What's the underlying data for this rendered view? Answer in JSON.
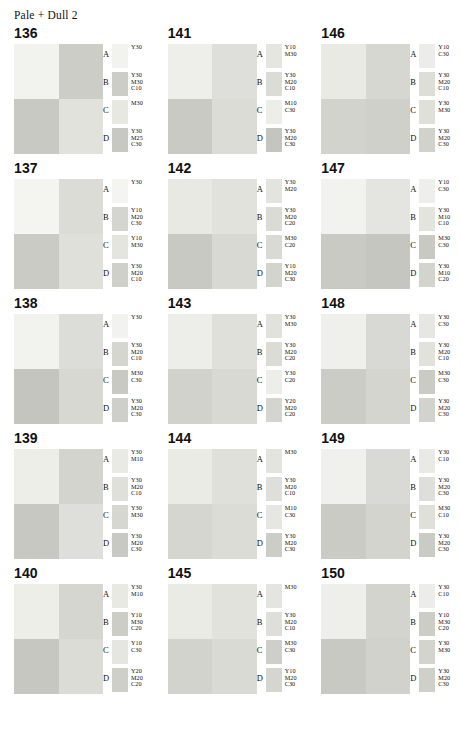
{
  "title": "Pale + Dull 2",
  "row_labels": [
    "A",
    "B",
    "C",
    "D"
  ],
  "chart_data": {
    "type": "table",
    "title": "Pale + Dull 2",
    "columns": 3,
    "rows": 5,
    "row_labels": [
      "A",
      "B",
      "C",
      "D"
    ],
    "groups": [
      {
        "number": "136",
        "quad": [
          "#f2f2ef",
          "#cdcdc8",
          "#c9c9c3",
          "#e2e2dd"
        ],
        "swatches": [
          {
            "label": "A",
            "chip": "#f2f2ef",
            "spec": "Y30"
          },
          {
            "label": "B",
            "chip": "#cdcdc8",
            "spec": "Y30\nM30\nC10"
          },
          {
            "label": "C",
            "chip": "#e8e8e2",
            "spec": "M30"
          },
          {
            "label": "D",
            "chip": "#c8c8c2",
            "spec": "Y30\nM25\nC30"
          }
        ]
      },
      {
        "number": "141",
        "quad": [
          "#eeeeea",
          "#dededa",
          "#cacac5",
          "#dcdcd7"
        ],
        "swatches": [
          {
            "label": "A",
            "chip": "#e6e6e1",
            "spec": "Y10\nM30"
          },
          {
            "label": "B",
            "chip": "#dcdcd7",
            "spec": "Y30\nM20\nC10"
          },
          {
            "label": "C",
            "chip": "#eeeee9",
            "spec": "M10\nC30"
          },
          {
            "label": "D",
            "chip": "#c5c5bf",
            "spec": "Y30\nM20\nC30"
          }
        ]
      },
      {
        "number": "146",
        "quad": [
          "#eaeae5",
          "#d7d7d2",
          "#d3d3ce",
          "#d0d0cb"
        ],
        "swatches": [
          {
            "label": "A",
            "chip": "#ececea",
            "spec": "Y10\nC30"
          },
          {
            "label": "B",
            "chip": "#dedeD9",
            "spec": "Y30\nM20\nC10"
          },
          {
            "label": "C",
            "chip": "#e0e0db",
            "spec": "Y30\nM30"
          },
          {
            "label": "D",
            "chip": "#d2d2cd",
            "spec": "Y30\nM20\nC30"
          }
        ]
      },
      {
        "number": "137",
        "quad": [
          "#f4f4f1",
          "#dcdcd7",
          "#cbcbc6",
          "#e0e0db"
        ],
        "swatches": [
          {
            "label": "A",
            "chip": "#f4f4f1",
            "spec": "Y30"
          },
          {
            "label": "B",
            "chip": "#d5d5d0",
            "spec": "Y10\nM20\nC30"
          },
          {
            "label": "C",
            "chip": "#e5e5e0",
            "spec": "Y10\nM30"
          },
          {
            "label": "D",
            "chip": "#d0d0cb",
            "spec": "Y30\nM20\nC10"
          }
        ]
      },
      {
        "number": "142",
        "quad": [
          "#e9e9e4",
          "#e2e2dd",
          "#c9c9c4",
          "#d9d9d4"
        ],
        "swatches": [
          {
            "label": "A",
            "chip": "#e4e4df",
            "spec": "Y30\nM20"
          },
          {
            "label": "B",
            "chip": "#dbdbd6",
            "spec": "Y30\nM20\nC20"
          },
          {
            "label": "C",
            "chip": "#dadad5",
            "spec": "M30\nC20"
          },
          {
            "label": "D",
            "chip": "#d4d4cf",
            "spec": "Y10\nM20\nC30"
          }
        ]
      },
      {
        "number": "147",
        "quad": [
          "#f2f2ef",
          "#e4e4e0",
          "#cacac5",
          "#c6c6c1"
        ],
        "swatches": [
          {
            "label": "A",
            "chip": "#eeeeec",
            "spec": "Y10\nC30"
          },
          {
            "label": "B",
            "chip": "#e4e4df",
            "spec": "Y30\nM10\nC10"
          },
          {
            "label": "C",
            "chip": "#c9c9c4",
            "spec": "M30\nC30"
          },
          {
            "label": "D",
            "chip": "#d4d4cf",
            "spec": "Y30\nM10\nC20"
          }
        ]
      },
      {
        "number": "138",
        "quad": [
          "#f2f2ef",
          "#dcdcd8",
          "#c5c5c0",
          "#d8d8d3"
        ],
        "swatches": [
          {
            "label": "A",
            "chip": "#f2f2ef",
            "spec": "Y30"
          },
          {
            "label": "B",
            "chip": "#d6d6d1",
            "spec": "Y30\nM20\nC10"
          },
          {
            "label": "C",
            "chip": "#c9c9c4",
            "spec": "M30\nC30"
          },
          {
            "label": "D",
            "chip": "#cfcfca",
            "spec": "Y30\nM20\nC30"
          }
        ]
      },
      {
        "number": "143",
        "quad": [
          "#ededea",
          "#e0e0db",
          "#d2d2cd",
          "#d9d9d4"
        ],
        "swatches": [
          {
            "label": "A",
            "chip": "#e2e2dd",
            "spec": "Y30\nM30"
          },
          {
            "label": "B",
            "chip": "#dcdcd7",
            "spec": "Y30\nM20\nC20"
          },
          {
            "label": "C",
            "chip": "#ededea",
            "spec": "Y30\nC20"
          },
          {
            "label": "D",
            "chip": "#d5d5d0",
            "spec": "Y20\nM20\nC20"
          }
        ]
      },
      {
        "number": "148",
        "quad": [
          "#efefec",
          "#d8d8d4",
          "#cccCC7",
          "#d5d5d0"
        ],
        "swatches": [
          {
            "label": "A",
            "chip": "#e6e6e3",
            "spec": "Y30\nC30"
          },
          {
            "label": "B",
            "chip": "#e2e2dd",
            "spec": "Y30\nM20\nC10"
          },
          {
            "label": "C",
            "chip": "#cbcbc6",
            "spec": "M30\nC30"
          },
          {
            "label": "D",
            "chip": "#d3d3ce",
            "spec": "Y30\nM20\nC30"
          }
        ]
      },
      {
        "number": "139",
        "quad": [
          "#eeeee9",
          "#d4d4cf",
          "#c8c8c3",
          "#dededa"
        ],
        "swatches": [
          {
            "label": "A",
            "chip": "#eaeae5",
            "spec": "Y30\nM10"
          },
          {
            "label": "B",
            "chip": "#e0e0db",
            "spec": "Y30\nM20\nC10"
          },
          {
            "label": "C",
            "chip": "#d7d7d2",
            "spec": "Y30\nM30"
          },
          {
            "label": "D",
            "chip": "#c9c9c4",
            "spec": "Y30\nM20\nC30"
          }
        ]
      },
      {
        "number": "144",
        "quad": [
          "#ebebe6",
          "#e0e0db",
          "#d6d6d1",
          "#dcdcd7"
        ],
        "swatches": [
          {
            "label": "A",
            "chip": "#e4e4df",
            "spec": "M30"
          },
          {
            "label": "B",
            "chip": "#dededa",
            "spec": "Y30\nM20\nC10"
          },
          {
            "label": "C",
            "chip": "#e6e6e2",
            "spec": "M10\nC30"
          },
          {
            "label": "D",
            "chip": "#cdcdc8",
            "spec": "Y30\nM20\nC30"
          }
        ]
      },
      {
        "number": "149",
        "quad": [
          "#f0f0ed",
          "#d9d9d5",
          "#cbcbc6",
          "#d4d4cf"
        ],
        "swatches": [
          {
            "label": "A",
            "chip": "#e9e9e6",
            "spec": "Y30\nC10"
          },
          {
            "label": "B",
            "chip": "#dededa",
            "spec": "Y30\nM20\nC30"
          },
          {
            "label": "C",
            "chip": "#e0e0db",
            "spec": "M30\nC10"
          },
          {
            "label": "D",
            "chip": "#cbcbc6",
            "spec": "Y30\nM20\nC30"
          }
        ]
      },
      {
        "number": "140",
        "quad": [
          "#eeeee9",
          "#d6d6d1",
          "#c7c7c2",
          "#dcdcd7"
        ],
        "swatches": [
          {
            "label": "A",
            "chip": "#e9e9e4",
            "spec": "Y30\nM10"
          },
          {
            "label": "B",
            "chip": "#cdcdc8",
            "spec": "Y10\nM30\nC20"
          },
          {
            "label": "C",
            "chip": "#e6e6e1",
            "spec": "Y10\nC30"
          },
          {
            "label": "D",
            "chip": "#cfcfca",
            "spec": "Y20\nM20\nC20"
          }
        ]
      },
      {
        "number": "145",
        "quad": [
          "#ebebe6",
          "#e2e2dd",
          "#d3d3ce",
          "#dadad5"
        ],
        "swatches": [
          {
            "label": "A",
            "chip": "#e4e4e0",
            "spec": "M30"
          },
          {
            "label": "B",
            "chip": "#dededa",
            "spec": "Y30\nM20\nC10"
          },
          {
            "label": "C",
            "chip": "#cececa",
            "spec": "M30\nC30"
          },
          {
            "label": "D",
            "chip": "#d6d6d1",
            "spec": "Y10\nM20\nC30"
          }
        ]
      },
      {
        "number": "150",
        "quad": [
          "#eeeeeb",
          "#d4d4cf",
          "#c9c9c4",
          "#d2d2cd"
        ],
        "swatches": [
          {
            "label": "A",
            "chip": "#ececea",
            "spec": "Y30\nC10"
          },
          {
            "label": "B",
            "chip": "#cdcdc8",
            "spec": "Y10\nM30\nC20"
          },
          {
            "label": "C",
            "chip": "#d4d4cf",
            "spec": "Y30\nM30"
          },
          {
            "label": "D",
            "chip": "#d0d0cb",
            "spec": "Y30\nM20\nC30"
          }
        ]
      }
    ]
  }
}
